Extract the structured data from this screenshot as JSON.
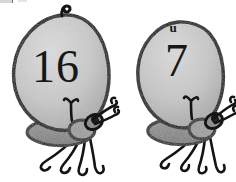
{
  "image": {
    "title": "Two hand-drawn bugs with numbers",
    "description": "Black-and-white hand-drawn illustration of two oval-bodied insects, each with a number written on its back, dark wings, a small head with one eye and antennae, and four thin curled legs.",
    "background_color": "#ffffff",
    "width": 236,
    "height": 182
  },
  "palette": {
    "outline": "#141414",
    "body_fill_light": "#d6d6d6",
    "body_fill_mid": "#c2c2c2",
    "body_shadow": "#a9a9a9",
    "wing_fill": "#8b8b8b",
    "head_fill": "#9a9a9a",
    "eye_fill": "#2a2a2a",
    "paper": "#ffffff",
    "ink_number": "#171717"
  },
  "bugs": [
    {
      "id": "bug-left",
      "position": "left",
      "number": "16",
      "top_marking": "",
      "top_stem": "curled-stem",
      "legs": 4,
      "antennae": 2,
      "eyes": 1,
      "wing": "dark-gray-wing"
    },
    {
      "id": "bug-right",
      "position": "right",
      "number": "7",
      "top_marking": "u",
      "top_stem": "none",
      "legs": 4,
      "antennae": 2,
      "eyes": 1,
      "wing": "dark-gray-wing"
    }
  ]
}
